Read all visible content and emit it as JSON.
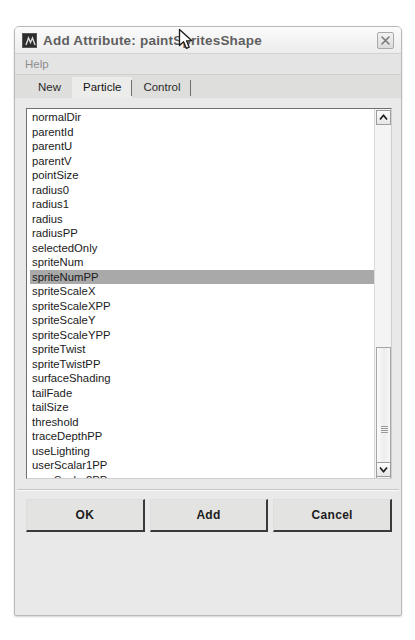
{
  "window": {
    "title": "Add Attribute: paintSpritesShape",
    "icon": "maya-app-icon",
    "close_label": "close-icon"
  },
  "menubar": {
    "items": [
      {
        "label": "Help"
      }
    ]
  },
  "tabs": [
    {
      "label": "New",
      "active": false
    },
    {
      "label": "Particle",
      "active": true
    },
    {
      "label": "Control",
      "active": false
    }
  ],
  "attribute_list": {
    "selected": "spriteNumPP",
    "items": [
      "normalDir",
      "parentId",
      "parentU",
      "parentV",
      "pointSize",
      "radius0",
      "radius1",
      "radius",
      "radiusPP",
      "selectedOnly",
      "spriteNum",
      "spriteNumPP",
      "spriteScaleX",
      "spriteScaleXPP",
      "spriteScaleY",
      "spriteScaleYPP",
      "spriteTwist",
      "spriteTwistPP",
      "surfaceShading",
      "tailFade",
      "tailSize",
      "threshold",
      "traceDepthPP",
      "useLighting",
      "userScalar1PP",
      "userScalar2PP",
      "userScalar3PP",
      "userScalar4PP",
      "userScalar5PP",
      "userVector1PP",
      "userVector2PP"
    ]
  },
  "scrollbar": {
    "up_arrow": "chevron-up-icon",
    "down_arrow": "chevron-down-icon"
  },
  "buttons": [
    {
      "label": "OK"
    },
    {
      "label": "Add"
    },
    {
      "label": "Cancel"
    }
  ],
  "colors": {
    "dialog_bg": "#e9e9e9",
    "list_bg": "#ffffff",
    "selection": "#a9a9a9",
    "title_text": "#5f5f5f",
    "button_bg": "#e3e3e1"
  }
}
